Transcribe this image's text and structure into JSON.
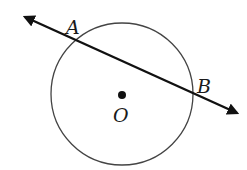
{
  "figure": {
    "colors": {
      "background": "#ffffff",
      "circle_stroke": "#444444",
      "line_stroke": "#111111",
      "label": "#1a1a1a"
    },
    "circle": {
      "cx": 122,
      "cy": 94,
      "r": 71
    },
    "secant_line": {
      "x1": 25,
      "y1": 17,
      "x2": 237,
      "y2": 113,
      "arrows": "both"
    },
    "points": [
      {
        "id": "A",
        "label": "A",
        "label_x": 66,
        "label_y": 34
      },
      {
        "id": "B",
        "label": "B",
        "label_x": 197,
        "label_y": 93
      },
      {
        "id": "O",
        "label": "O",
        "x": 122,
        "y": 95,
        "label_x": 113,
        "label_y": 122
      }
    ]
  }
}
